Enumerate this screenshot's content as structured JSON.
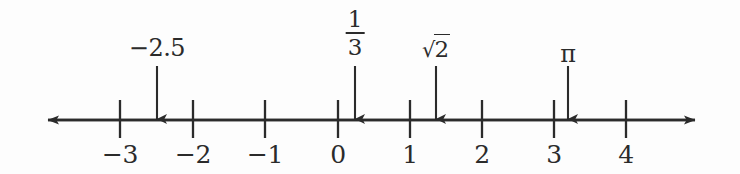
{
  "figure": {
    "background_color": "#fdfdfd",
    "ink_color": "#2b2b2b"
  },
  "chart_data": {
    "type": "numberline",
    "title": "",
    "xlabel": "",
    "ylabel": "",
    "axis": {
      "orientation": "horizontal",
      "min_tick": -3,
      "max_tick": 4,
      "tick_step": 1,
      "arrows": "both",
      "line_y_px": 120,
      "x_at_zero_px": 338,
      "pixels_per_unit": 72.3,
      "left_arrow_tip_px": 37,
      "right_arrow_tip_px": 706
    },
    "ticks": [
      {
        "value": -3,
        "label": "−3",
        "x_px": 120
      },
      {
        "value": -2,
        "label": "−2",
        "x_px": 193
      },
      {
        "value": -1,
        "label": "−1",
        "x_px": 265
      },
      {
        "value": 0,
        "label": "0",
        "x_px": 338
      },
      {
        "value": 1,
        "label": "1",
        "x_px": 410
      },
      {
        "value": 2,
        "label": "2",
        "x_px": 482
      },
      {
        "value": 3,
        "label": "3",
        "x_px": 554
      },
      {
        "value": 4,
        "label": "4",
        "x_px": 626
      }
    ],
    "marked_points": [
      {
        "name": "negative-two-point-five",
        "label": "−2.5",
        "label_kind": "plain",
        "value": -2.5,
        "x_px": 157,
        "arrow_top_px": 66,
        "label_y_px": 36
      },
      {
        "name": "one-third",
        "label": "1/3",
        "label_kind": "fraction",
        "numerator": "1",
        "denominator": "3",
        "value": 0.333,
        "x_px": 355,
        "arrow_top_px": 66,
        "label_y_px": 8
      },
      {
        "name": "square-root-of-two",
        "label": "√2",
        "label_kind": "radical",
        "radicand": "2",
        "value": 1.414,
        "x_px": 436,
        "arrow_top_px": 66,
        "label_y_px": 38
      },
      {
        "name": "pi",
        "label": "π",
        "label_kind": "plain",
        "value": 3.1416,
        "x_px": 568,
        "arrow_top_px": 66,
        "label_y_px": 42
      }
    ]
  }
}
